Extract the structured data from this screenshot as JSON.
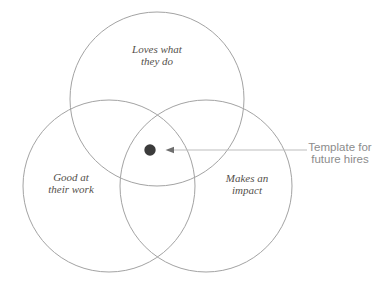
{
  "diagram": {
    "type": "venn",
    "circles": [
      {
        "label_line1": "Loves what",
        "label_line2": "they do"
      },
      {
        "label_line1": "Good at",
        "label_line2": "their work"
      },
      {
        "label_line1": "Makes an",
        "label_line2": "impact"
      }
    ],
    "annotation": {
      "line1": "Template for",
      "line2": "future hires"
    },
    "colors": {
      "background": "#ffffff",
      "circle_stroke": "#a3a3a3",
      "dot_fill": "#3b3b3b",
      "arrow_line": "#bdbdbd",
      "arrow_head": "#6e6e6e",
      "circle_label": "#54504b",
      "annotation_text": "#8c8c8c"
    }
  }
}
